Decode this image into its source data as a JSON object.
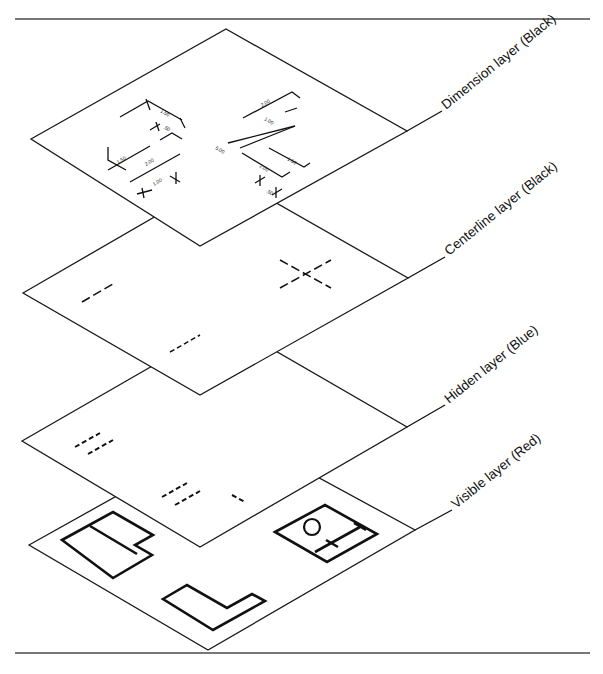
{
  "diagram": {
    "layers": [
      {
        "id": "dimension",
        "label": "Dimension layer (Black)",
        "color": "#000000"
      },
      {
        "id": "centerline",
        "label": "Centerline layer (Black)",
        "color": "#000000"
      },
      {
        "id": "hidden",
        "label": "Hidden layer (Blue)",
        "color": "#0000FF"
      },
      {
        "id": "visible",
        "label": "Visible layer (Red)",
        "color": "#FF0000"
      }
    ],
    "dimensions": [
      "1.50",
      ".50",
      "1.50",
      "2.00",
      "1.00",
      "2.00",
      "1.00",
      "5.00",
      "2.00",
      "1.50",
      ".50"
    ]
  }
}
